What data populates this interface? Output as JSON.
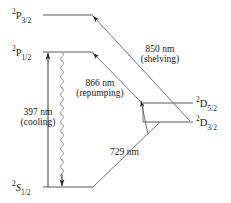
{
  "figure": {
    "type": "energy-level-diagram",
    "stroke_color": "#3c3c3c",
    "text_color": "#1a1a1a",
    "background": "#ffffff"
  },
  "levels": [
    {
      "id": "p32",
      "sup": "2",
      "term": "P",
      "sub": "3/2",
      "label": "2P3/2",
      "x1": 43,
      "x2": 93,
      "y": 15,
      "label_x": 12,
      "label_y": 9
    },
    {
      "id": "p12",
      "sup": "2",
      "term": "P",
      "sub": "1/2",
      "label": "2P1/2",
      "x1": 43,
      "x2": 93,
      "y": 52,
      "label_x": 12,
      "label_y": 46
    },
    {
      "id": "d52",
      "sup": "2",
      "term": "D",
      "sub": "5/2",
      "label": "2D5/2",
      "x1": 143,
      "x2": 193,
      "y": 103,
      "label_x": 196,
      "label_y": 97
    },
    {
      "id": "d32",
      "sup": "2",
      "term": "D",
      "sub": "3/2",
      "label": "2D3/2",
      "x1": 143,
      "x2": 193,
      "y": 122,
      "label_x": 196,
      "label_y": 116
    },
    {
      "id": "s12",
      "sup": "2",
      "term": "S",
      "sub": "1/2",
      "label": "2S1/2",
      "x1": 43,
      "x2": 93,
      "y": 187,
      "label_x": 12,
      "label_y": 181
    }
  ],
  "transitions": [
    {
      "id": "cooling",
      "wavelength": "397 nm",
      "role": "(cooling)",
      "from": "s12",
      "to": "p12",
      "style": "straight-arrow-up",
      "label_x": 10,
      "label_y": 108
    },
    {
      "id": "repumping",
      "wavelength": "866 nm",
      "role": "(repumping)",
      "from": "d32",
      "to": "p12",
      "style": "diagonal-double",
      "label_x": 66,
      "label_y": 79
    },
    {
      "id": "shelving",
      "wavelength": "850 nm",
      "role": "(shelving)",
      "from": "d32",
      "to": "p32",
      "style": "diagonal",
      "label_x": 130,
      "label_y": 45
    },
    {
      "id": "clock",
      "wavelength": "729 nm",
      "role": "",
      "from": "s12",
      "to": "d52",
      "style": "diagonal",
      "label_x": 112,
      "label_y": 148
    }
  ],
  "decay": {
    "id": "spontaneous-emission",
    "style": "wavy",
    "from": "p12",
    "to": "s12",
    "x": 62,
    "y_top": 52,
    "y_bottom": 187
  }
}
